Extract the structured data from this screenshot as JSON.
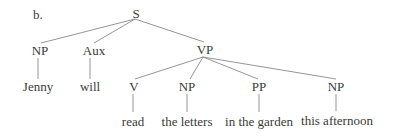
{
  "diagram": {
    "label": "b.",
    "type": "syntax-tree",
    "nodes": {
      "S": "S",
      "NP_subj": "NP",
      "Aux": "Aux",
      "VP": "VP",
      "V": "V",
      "NP_obj": "NP",
      "PP": "PP",
      "NP_time": "NP"
    },
    "leaves": {
      "jenny": "Jenny",
      "will": "will",
      "read": "read",
      "the_letters": "the letters",
      "in_the_garden": "in the garden",
      "this_afternoon": "this afternoon"
    },
    "edges": [
      [
        "S",
        "NP"
      ],
      [
        "S",
        "Aux"
      ],
      [
        "S",
        "VP"
      ],
      [
        "NP",
        "Jenny"
      ],
      [
        "Aux",
        "will"
      ],
      [
        "VP",
        "V"
      ],
      [
        "VP",
        "NP"
      ],
      [
        "VP",
        "PP"
      ],
      [
        "VP",
        "NP"
      ],
      [
        "V",
        "read"
      ],
      [
        "NP",
        "the letters"
      ],
      [
        "PP",
        "in the garden"
      ],
      [
        "NP",
        "this afternoon"
      ]
    ]
  }
}
